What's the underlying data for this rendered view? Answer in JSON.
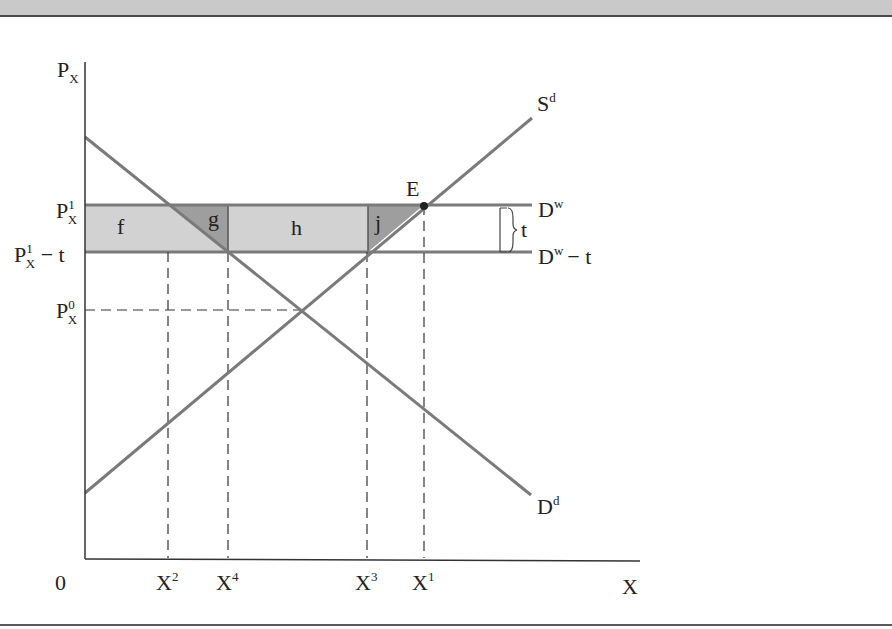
{
  "figure": {
    "y_axis_label": "P",
    "y_axis_sub": "X",
    "x_axis_label": "X",
    "origin_label": "0",
    "price_labels": [
      {
        "id": "p1",
        "base": "P",
        "sup": "1",
        "sub": "X",
        "suffix": ""
      },
      {
        "id": "p1t",
        "base": "P",
        "sup": "1",
        "sub": "X",
        "suffix": " − t"
      },
      {
        "id": "p0",
        "base": "P",
        "sup": "0",
        "sub": "X",
        "suffix": ""
      }
    ],
    "quantity_labels": [
      {
        "id": "x2",
        "base": "X",
        "sup": "2"
      },
      {
        "id": "x4",
        "base": "X",
        "sup": "4"
      },
      {
        "id": "x3",
        "base": "X",
        "sup": "3"
      },
      {
        "id": "x1",
        "base": "X",
        "sup": "1"
      }
    ],
    "curves": {
      "supply": {
        "base": "S",
        "sup": "d"
      },
      "demand": {
        "base": "D",
        "sup": "d"
      },
      "world": {
        "base": "D",
        "sup": "w",
        "suffix": ""
      },
      "world_minus_tax": {
        "base": "D",
        "sup": "w",
        "suffix": "− t"
      }
    },
    "areas": {
      "f": "f",
      "g": "g",
      "h": "h",
      "j": "j"
    },
    "point_label": "E",
    "brace_label": "t",
    "colors": {
      "curve": "#7a7a7a",
      "light_fill": "#d2d2d2",
      "dark_fill": "#9e9e9e",
      "axis": "#333333",
      "top_strip": "#c9c9c9"
    }
  }
}
